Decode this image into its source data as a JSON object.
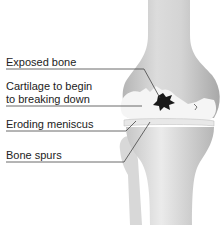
{
  "diagram": {
    "labels": [
      {
        "id": "exposed-bone",
        "text": "Exposed bone"
      },
      {
        "id": "cartilage",
        "line1": "Cartilage to begin",
        "line2": "to breaking down"
      },
      {
        "id": "eroding-meniscus",
        "text": "Eroding meniscus"
      },
      {
        "id": "bone-spurs",
        "text": "Bone spurs"
      }
    ],
    "colors": {
      "bone": "#d6d6d6",
      "bone_shadow": "#a9a9a9",
      "cartilage": "#f4f4f4",
      "lesion": "#1a1a1a",
      "leader_line": "#444444",
      "text": "#222222"
    }
  }
}
